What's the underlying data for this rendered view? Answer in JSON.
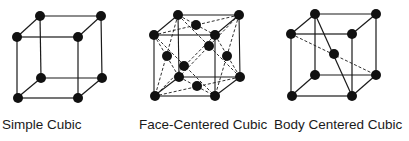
{
  "diagram": {
    "structures": [
      {
        "id": "simple-cubic",
        "label": "Simple Cubic",
        "atoms": 8
      },
      {
        "id": "face-centered-cubic",
        "label": "Face-Centered Cubic",
        "atoms": 14
      },
      {
        "id": "body-centered-cubic",
        "label": "Body Centered Cubic",
        "atoms": 9
      }
    ],
    "colors": {
      "line": "#1a1a1a",
      "atom": "#111111",
      "background": "#ffffff"
    }
  }
}
